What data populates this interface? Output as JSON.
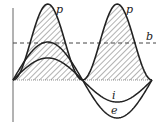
{
  "diagram": {
    "labels": {
      "power_peak_1": "p",
      "power_peak_2": "p",
      "average_line": "b",
      "current": "i",
      "voltage": "e"
    },
    "colors": {
      "curve": "#222222",
      "axis": "#555555",
      "hatch": "#555555",
      "dashed_line": "#444444",
      "background": "#ffffff"
    },
    "geometry": {
      "axis_x": 13,
      "baseline_y": 80,
      "dashed_y": 43,
      "period_px": 139,
      "zero_crossings_x": [
        13,
        82,
        152
      ],
      "power_peak_y": 4,
      "voltage_amplitude_px": 38,
      "current_amplitude_px": 22
    }
  }
}
